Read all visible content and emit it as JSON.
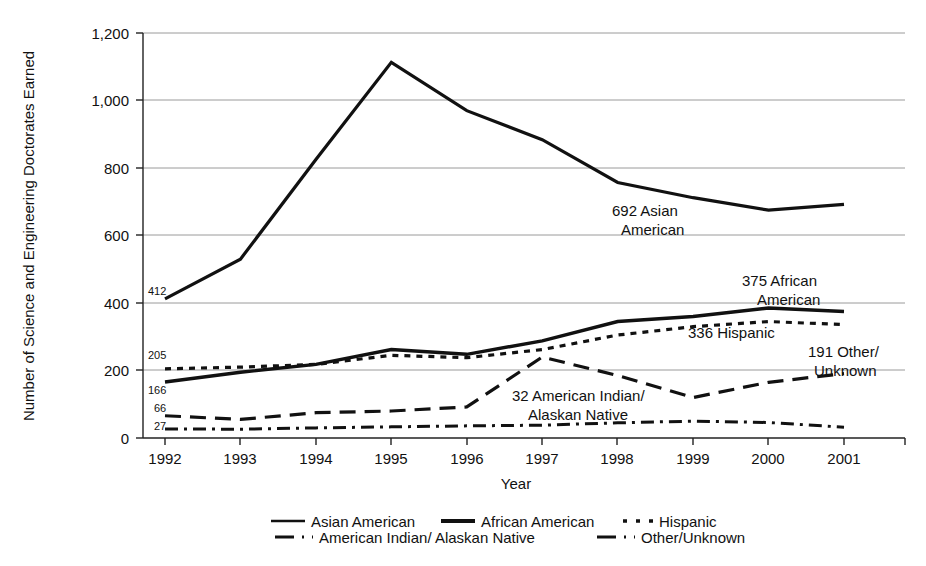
{
  "chart_data": {
    "type": "line",
    "title": "",
    "xlabel": "Year",
    "ylabel": "Number of Science and Engineering Doctorates Earned",
    "categories": [
      "1992",
      "1993",
      "1994",
      "1995",
      "1996",
      "1997",
      "1998",
      "1999",
      "2000",
      "2001"
    ],
    "x": [
      1992,
      1993,
      1994,
      1995,
      1996,
      1997,
      1998,
      1999,
      2000,
      2001
    ],
    "xlim": [
      1992,
      2001
    ],
    "ylim": [
      0,
      1200
    ],
    "yticks": [
      "0",
      "200",
      "400",
      "600",
      "800",
      "1,000",
      "1,200"
    ],
    "ytick_values": [
      0,
      200,
      400,
      600,
      800,
      1000,
      1200
    ],
    "grid": "horizontal",
    "legend_position": "bottom",
    "series": [
      {
        "name": "Asian American",
        "style": "solid",
        "values": [
          412,
          530,
          825,
          1113,
          970,
          884,
          757,
          712,
          675,
          692
        ]
      },
      {
        "name": "African American",
        "style": "solid",
        "values": [
          166,
          195,
          218,
          262,
          248,
          288,
          345,
          360,
          385,
          375
        ]
      },
      {
        "name": "Hispanic",
        "style": "dotted",
        "values": [
          205,
          210,
          218,
          245,
          238,
          262,
          305,
          330,
          345,
          336
        ]
      },
      {
        "name": "American Indian/ Alaskan Native",
        "style": "dash-dot",
        "values": [
          27,
          26,
          30,
          33,
          36,
          38,
          45,
          50,
          46,
          32
        ]
      },
      {
        "name": "Other/Unknown",
        "style": "dashed",
        "values": [
          66,
          55,
          75,
          80,
          92,
          240,
          185,
          120,
          165,
          191
        ]
      }
    ],
    "start_labels": [
      {
        "text": "412",
        "series": "Asian American",
        "value": 412,
        "year": 1992
      },
      {
        "text": "205",
        "series": "Hispanic",
        "value": 205,
        "year": 1992
      },
      {
        "text": "166",
        "series": "African American",
        "value": 166,
        "year": 1992
      },
      {
        "text": "66",
        "series": "Other/Unknown",
        "value": 66,
        "year": 1992
      },
      {
        "text": "27",
        "series": "American Indian/ Alaskan Native",
        "value": 27,
        "year": 1992
      }
    ],
    "annotations": [
      {
        "line1": "692 Asian",
        "line2": "American",
        "series": "Asian American",
        "value": 692,
        "year": 2001
      },
      {
        "line1": "375 African",
        "line2": "American",
        "series": "African American",
        "value": 375,
        "year": 2001
      },
      {
        "line1": "336 Hispanic",
        "line2": "",
        "series": "Hispanic",
        "value": 336,
        "year": 2001
      },
      {
        "line1": "191 Other/",
        "line2": "Unknown",
        "series": "Other/Unknown",
        "value": 191,
        "year": 2001
      },
      {
        "line1": "32 American Indian/",
        "line2": "Alaskan Native",
        "series": "American Indian/ Alaskan Native",
        "value": 32,
        "year": 2001
      }
    ]
  },
  "axes": {
    "y_title": "Number of Science and Engineering Doctorates Earned",
    "x_title": "Year",
    "y_tick_1200": "1,200",
    "y_tick_1000": "1,000",
    "y_tick_800": "800",
    "y_tick_600": "600",
    "y_tick_400": "400",
    "y_tick_200": "200",
    "y_tick_0": "0",
    "x_tick_1992": "1992",
    "x_tick_1993": "1993",
    "x_tick_1994": "1994",
    "x_tick_1995": "1995",
    "x_tick_1996": "1996",
    "x_tick_1997": "1997",
    "x_tick_1998": "1998",
    "x_tick_1999": "1999",
    "x_tick_2000": "2000",
    "x_tick_2001": "2001"
  },
  "start_labels": {
    "asian": "412",
    "hispanic": "205",
    "african": "166",
    "other": "66",
    "indian": "27"
  },
  "annotations": {
    "asian_l1": "692 Asian",
    "asian_l2": "American",
    "african_l1": "375 African",
    "african_l2": "American",
    "hispanic_l1": "336 Hispanic",
    "other_l1": "191 Other/",
    "other_l2": "Unknown",
    "indian_l1": "32 American Indian/",
    "indian_l2": "Alaskan Native"
  },
  "legend": {
    "row1": [
      {
        "label": "Asian American",
        "style": "solid-thin"
      },
      {
        "label": "African American",
        "style": "solid-thick"
      },
      {
        "label": "Hispanic",
        "style": "dotted"
      }
    ],
    "row2": [
      {
        "label": "American Indian/ Alaskan Native",
        "style": "dash-dot"
      },
      {
        "label": "Other/Unknown",
        "style": "dashed"
      }
    ],
    "item_asian": "Asian American",
    "item_african": "African American",
    "item_hispanic": "Hispanic",
    "item_indian": "American Indian/ Alaskan Native",
    "item_other": "Other/Unknown"
  },
  "colors": {
    "ink": "#111111",
    "grid": "#9a9a9a",
    "background": "#ffffff"
  }
}
